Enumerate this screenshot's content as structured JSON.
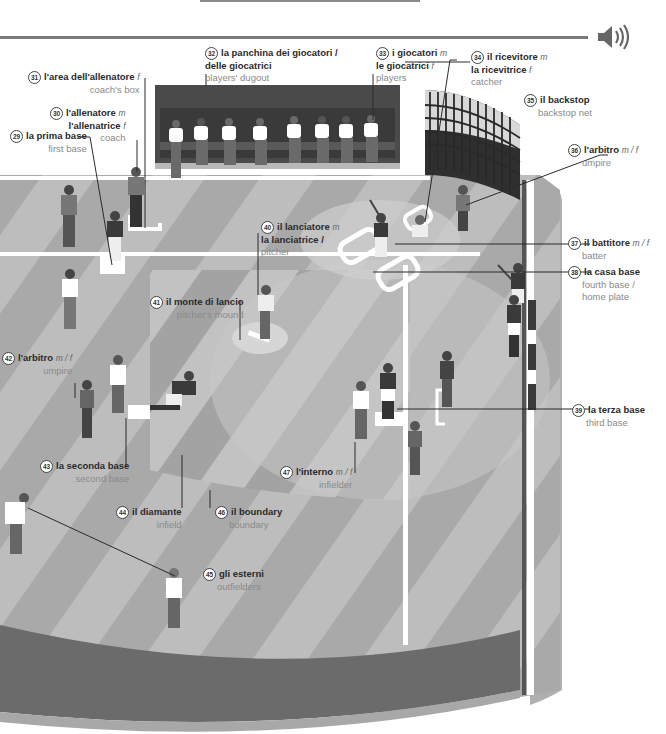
{
  "header": {
    "audio_icon": "speaker-icon"
  },
  "colors": {
    "field_light": "#bdbdbd",
    "field_stripe": "#a9a9a9",
    "infield": "#c6c6c6",
    "infield_stripe": "#9e9e9e",
    "wall": "#6e6e6e",
    "dugout": "#4a4a4a",
    "line": "#ffffff",
    "text_primary": "#2b2b2b",
    "text_secondary": "#8a8a8a"
  },
  "labels": [
    {
      "id": "29",
      "num": "29",
      "it": "la prima base",
      "gender": "",
      "en": "first base"
    },
    {
      "id": "30",
      "num": "30",
      "it": "l'allenatore",
      "gender": "m",
      "it2": "l'allenatrice",
      "gender2": "f",
      "en": "coach"
    },
    {
      "id": "31",
      "num": "31",
      "it": "l'area dell'allenatore",
      "gender": "f",
      "en": "coach's box"
    },
    {
      "id": "32",
      "num": "32",
      "it": "la panchina dei giocatori /",
      "gender": "",
      "it2": "delle giocatrici",
      "gender2": "",
      "en": "players' dugout"
    },
    {
      "id": "33",
      "num": "33",
      "it": "i giocatori",
      "gender": "m",
      "it2": "le giocatrici",
      "gender2": "f",
      "en": "players"
    },
    {
      "id": "34",
      "num": "34",
      "it": "il ricevitore",
      "gender": "m",
      "it2": "la ricevitrice",
      "gender2": "f",
      "en": "catcher"
    },
    {
      "id": "35",
      "num": "35",
      "it": "il backstop",
      "gender": "",
      "en": "backstop net"
    },
    {
      "id": "36",
      "num": "36",
      "it": "l'arbitro",
      "gender": "m / f",
      "en": "umpire"
    },
    {
      "id": "37",
      "num": "37",
      "it": "il battitore",
      "gender": "m / f",
      "en": "batter"
    },
    {
      "id": "38",
      "num": "38",
      "it": "la casa base",
      "gender": "",
      "en": "fourth base /",
      "en2": "home plate"
    },
    {
      "id": "39",
      "num": "39",
      "it": "la terza base",
      "gender": "",
      "en": "third base"
    },
    {
      "id": "40",
      "num": "40",
      "it": "il lanciatore",
      "gender": "m",
      "it2": "la lanciatrice /",
      "gender2": "",
      "en": "pitcher"
    },
    {
      "id": "41",
      "num": "41",
      "it": "il monte di lancio",
      "gender": "",
      "en": "pitcher's mound"
    },
    {
      "id": "42",
      "num": "42",
      "it": "l'arbitro",
      "gender": "m / f",
      "en": "umpire"
    },
    {
      "id": "43",
      "num": "43",
      "it": "la seconda base",
      "gender": "",
      "en": "second base"
    },
    {
      "id": "44",
      "num": "44",
      "it": "il diamante",
      "gender": "",
      "en": "infield"
    },
    {
      "id": "45",
      "num": "45",
      "it": "gli esterni",
      "gender": "",
      "en": "outfielders"
    },
    {
      "id": "46",
      "num": "46",
      "it": "il boundary",
      "gender": "",
      "en": "boundary"
    },
    {
      "id": "47",
      "num": "47",
      "it": "l'interno",
      "gender": "m / f",
      "en": "infielder"
    }
  ]
}
